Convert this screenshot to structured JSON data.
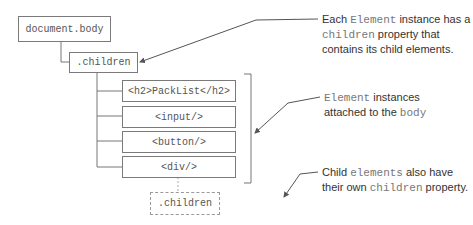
{
  "nodes": {
    "body": "document.body",
    "children": ".children",
    "h2": "<h2>PackList</h2>",
    "input": "<input/>",
    "button": "<button/>",
    "div": "<div/>",
    "div_children": ".children"
  },
  "annotations": {
    "a1": {
      "t1": "Each ",
      "c1": "Element",
      "t2": " instance has a",
      "c2": "children",
      "t3": " property that",
      "t4": "contains its child elements."
    },
    "a2": {
      "c1": "Element",
      "t1": " instances",
      "t2": "attached to the ",
      "c2": "body"
    },
    "a3": {
      "t1": "Child ",
      "c1": "elements",
      "t2": " also have",
      "t3": "their own ",
      "c2": "children",
      "t4": " property."
    }
  }
}
